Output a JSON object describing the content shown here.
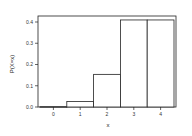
{
  "chart_data": {
    "type": "bar",
    "title": "",
    "xlabel": "x",
    "ylabel": "P(X=x)",
    "categories": [
      "0",
      "1",
      "2",
      "3",
      "4"
    ],
    "values": [
      0.0016,
      0.0256,
      0.1536,
      0.4096,
      0.4096
    ],
    "ylim": [
      0,
      0.42
    ],
    "yticks": [
      0.0,
      0.1,
      0.2,
      0.3,
      0.4
    ],
    "ytick_labels": [
      "0.0",
      "0.1",
      "0.2",
      "0.3",
      "0.4"
    ],
    "grid": false,
    "legend": null,
    "bar_fill": "#ffffff",
    "bar_edge": "#222222"
  }
}
